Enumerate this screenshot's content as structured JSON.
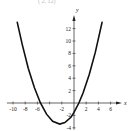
{
  "caption_partial": "(   2,   12)",
  "chart_data": {
    "type": "line",
    "title": "",
    "xlabel": "x",
    "ylabel": "y",
    "xlim": [
      -11,
      7.5
    ],
    "ylim": [
      -4.3,
      14.5
    ],
    "x_ticks": [
      -10,
      -8,
      -6,
      -4,
      -2,
      2,
      4,
      6
    ],
    "x_tick_labels": [
      "-10",
      "-8",
      "-6",
      "-2",
      "2",
      "4",
      "6"
    ],
    "x_tick_label_values": [
      -10,
      -8,
      -6,
      -2,
      2,
      4,
      6
    ],
    "y_ticks": [
      -4,
      -2,
      2,
      4,
      6,
      8,
      10,
      12
    ],
    "y_tick_labels": [
      "12",
      "10",
      "8",
      "6",
      "4",
      "2",
      "-2",
      "-4"
    ],
    "y_tick_label_values": [
      12,
      10,
      8,
      6,
      4,
      2,
      -2,
      -4
    ],
    "grid": false,
    "legend": "none",
    "series": [
      {
        "name": "parabola",
        "description": "Upward-opening parabola, vertex approx (-2.35, -3.4), x-intercepts approx -5.5 and 0.8, y-intercept approx -1.5",
        "x": [
          -9.3,
          -8.5,
          -7.5,
          -6.5,
          -5.5,
          -4.5,
          -3.5,
          -2.35,
          -1.5,
          -0.5,
          0,
          0.8,
          1.5,
          2.5,
          3.5,
          4.6
        ],
        "y": [
          13.0,
          9.5,
          5.6,
          2.5,
          -0.0,
          -1.8,
          -2.95,
          -3.4,
          -3.15,
          -2.3,
          -1.52,
          0.0,
          1.64,
          4.6,
          8.2,
          13.0
        ]
      }
    ]
  }
}
